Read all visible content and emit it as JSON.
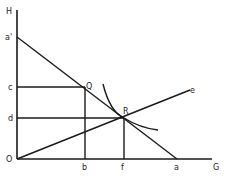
{
  "diagram": {
    "type": "economics-budget-line-diagram",
    "colors": {
      "line": "#1a1a1a",
      "text": "#222222",
      "background": "#ffffff"
    },
    "labels": {
      "H": "H",
      "a_prime": "a'",
      "c": "c",
      "d": "d",
      "O": "O",
      "b": "b",
      "f": "f",
      "a": "a",
      "G": "G",
      "Q": "Q",
      "R": "R",
      "e": "e"
    },
    "points": {
      "O": [
        17,
        159
      ],
      "H": [
        17,
        10
      ],
      "G": [
        212,
        159
      ],
      "a_prime": [
        17,
        37
      ],
      "a": [
        177,
        159
      ],
      "Q": [
        85,
        87
      ],
      "R": [
        124,
        118
      ],
      "e": [
        190,
        90
      ],
      "c": [
        17,
        87
      ],
      "d": [
        17,
        118
      ],
      "b": [
        85,
        159
      ],
      "f": [
        124,
        159
      ]
    },
    "lines": [
      {
        "name": "vertical-axis",
        "from": "O",
        "to": "H"
      },
      {
        "name": "horizontal-axis",
        "from": "O",
        "to": "G"
      },
      {
        "name": "budget-line",
        "from": "a_prime",
        "to": "a"
      },
      {
        "name": "ray-Oe",
        "from": "O",
        "to": "e"
      },
      {
        "name": "horizontal-cQ",
        "from": "c",
        "to": "Q"
      },
      {
        "name": "horizontal-dR",
        "from": "d",
        "to": "R"
      },
      {
        "name": "vertical-Qb",
        "from": "Q",
        "to": "b"
      },
      {
        "name": "vertical-Rf",
        "from": "R",
        "to": "f"
      }
    ],
    "curve": {
      "name": "indifference-curve",
      "tangent_at": "R"
    }
  }
}
